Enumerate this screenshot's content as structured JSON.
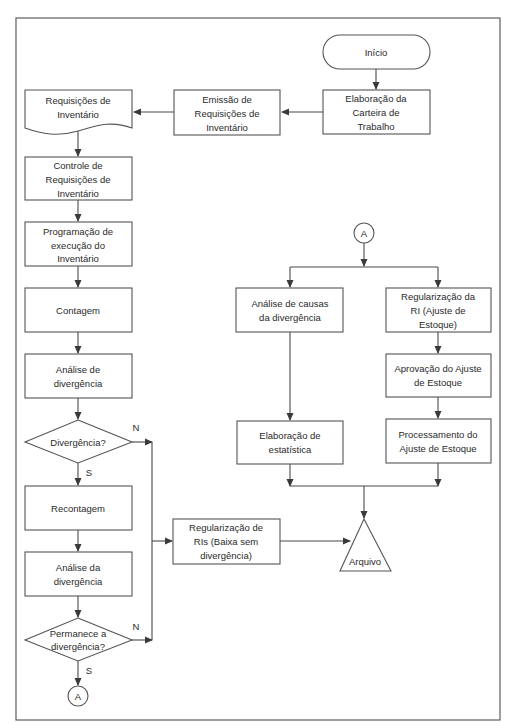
{
  "diagram": {
    "type": "flowchart",
    "language": "pt-BR",
    "colors": {
      "stroke": "#555555",
      "text": "#2a2a2a",
      "background": "#ffffff"
    },
    "nodes": {
      "inicio": {
        "shape": "terminal",
        "lines": [
          "Início"
        ]
      },
      "elaboracao_carteira": {
        "shape": "process",
        "lines": [
          "Elaboração da",
          "Carteira de",
          "Trabalho"
        ]
      },
      "emissao_requisicoes": {
        "shape": "process",
        "lines": [
          "Emissão de",
          "Requisições de",
          "Inventário"
        ]
      },
      "requisicoes_inventario": {
        "shape": "document",
        "lines": [
          "Requisições de",
          "Inventário"
        ]
      },
      "controle_requisicoes": {
        "shape": "process",
        "lines": [
          "Controle de",
          "Requisições de",
          "Inventário"
        ]
      },
      "programacao_execucao": {
        "shape": "process",
        "lines": [
          "Programação de",
          "execução do",
          "Inventário"
        ]
      },
      "contagem": {
        "shape": "process",
        "lines": [
          "Contagem"
        ]
      },
      "analise_de_divergencia": {
        "shape": "process",
        "lines": [
          "Análise de",
          "divergência"
        ]
      },
      "decisao_divergencia": {
        "shape": "decision",
        "lines": [
          "Divergência?"
        ]
      },
      "recontagem": {
        "shape": "process",
        "lines": [
          "Recontagem"
        ]
      },
      "analise_da_divergencia": {
        "shape": "process",
        "lines": [
          "Análise da",
          "divergência"
        ]
      },
      "decisao_permanece": {
        "shape": "decision",
        "lines": [
          "Permanece a",
          "divergência?"
        ]
      },
      "connector_out": {
        "shape": "connector",
        "lines": [
          "A"
        ]
      },
      "connector_in": {
        "shape": "connector",
        "lines": [
          "A"
        ]
      },
      "analise_causas": {
        "shape": "process",
        "lines": [
          "Análise de causas",
          "da divergência"
        ]
      },
      "elaboracao_estatistica": {
        "shape": "process",
        "lines": [
          "Elaboração de",
          "estatística"
        ]
      },
      "regularizacao_ri": {
        "shape": "process",
        "lines": [
          "Regularização da",
          "RI (Ajuste de",
          "Estoque)"
        ]
      },
      "aprovacao_ajuste": {
        "shape": "process",
        "lines": [
          "Aprovação do Ajuste",
          "de Estoque"
        ]
      },
      "processamento_ajuste": {
        "shape": "process",
        "lines": [
          "Processamento do",
          "Ajuste de Estoque"
        ]
      },
      "regularizacao_ris": {
        "shape": "process",
        "lines": [
          "Regularização  de",
          "RIs (Baixa sem",
          "divergência)"
        ]
      },
      "arquivo": {
        "shape": "storage",
        "lines": [
          "Arquivo"
        ]
      }
    },
    "edge_labels": {
      "divergencia_no": "N",
      "divergencia_yes": "S",
      "permanece_no": "N",
      "permanece_yes": "S"
    },
    "edges": [
      [
        "inicio",
        "elaboracao_carteira"
      ],
      [
        "elaboracao_carteira",
        "emissao_requisicoes"
      ],
      [
        "emissao_requisicoes",
        "requisicoes_inventario"
      ],
      [
        "requisicoes_inventario",
        "controle_requisicoes"
      ],
      [
        "controle_requisicoes",
        "programacao_execucao"
      ],
      [
        "programacao_execucao",
        "contagem"
      ],
      [
        "contagem",
        "analise_de_divergencia"
      ],
      [
        "analise_de_divergencia",
        "decisao_divergencia"
      ],
      [
        "decisao_divergencia",
        "recontagem",
        "S"
      ],
      [
        "decisao_divergencia",
        "regularizacao_ris",
        "N"
      ],
      [
        "recontagem",
        "analise_da_divergencia"
      ],
      [
        "analise_da_divergencia",
        "decisao_permanece"
      ],
      [
        "decisao_permanece",
        "connector_out",
        "S"
      ],
      [
        "decisao_permanece",
        "regularizacao_ris",
        "N"
      ],
      [
        "connector_in",
        "analise_causas"
      ],
      [
        "connector_in",
        "regularizacao_ri"
      ],
      [
        "analise_causas",
        "elaboracao_estatistica"
      ],
      [
        "regularizacao_ri",
        "aprovacao_ajuste"
      ],
      [
        "aprovacao_ajuste",
        "processamento_ajuste"
      ],
      [
        "elaboracao_estatistica",
        "arquivo"
      ],
      [
        "processamento_ajuste",
        "arquivo"
      ],
      [
        "regularizacao_ris",
        "arquivo"
      ]
    ]
  }
}
